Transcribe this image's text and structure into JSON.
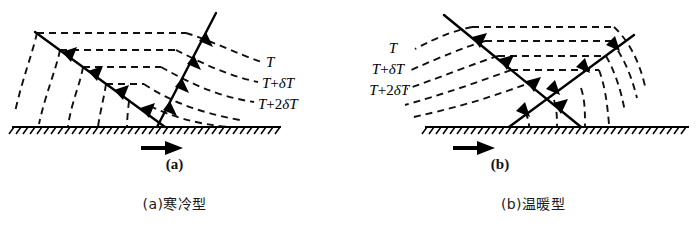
{
  "figure": {
    "title": "",
    "background_color": "#ffffff",
    "line_color": "#000000",
    "width": 697,
    "height": 227
  },
  "panels": [
    {
      "id": "a",
      "sub_label": "(a)",
      "caption": "(a)寒冷型",
      "label_side": "right",
      "isotherms": [
        {
          "main": "T",
          "operator": "",
          "coefficient": "",
          "delta": "",
          "suffix": ""
        },
        {
          "main": "T",
          "operator": "+",
          "coefficient": "",
          "delta": "δ",
          "suffix": "T"
        },
        {
          "main": "T",
          "operator": "+",
          "coefficient": "2",
          "delta": "δ",
          "suffix": "T"
        }
      ],
      "isotherm_labels_plain": [
        "T",
        "T+δT",
        "T+2δT"
      ],
      "flow_arrow": {
        "direction": "right",
        "name": "surface-flow-arrow"
      },
      "ground": {
        "style": "hatched",
        "hatch_direction": "right-leaning"
      }
    },
    {
      "id": "b",
      "sub_label": "(b)",
      "caption": "(b)温暖型",
      "label_side": "left",
      "isotherms": [
        {
          "main": "T",
          "operator": "",
          "coefficient": "",
          "delta": "",
          "suffix": ""
        },
        {
          "main": "T",
          "operator": "+",
          "coefficient": "",
          "delta": "δ",
          "suffix": "T"
        },
        {
          "main": "T",
          "operator": "+",
          "coefficient": "2",
          "delta": "δ",
          "suffix": "T"
        }
      ],
      "isotherm_labels_plain": [
        "T",
        "T+δT",
        "T+2δT"
      ],
      "flow_arrow": {
        "direction": "right",
        "name": "surface-flow-arrow"
      },
      "ground": {
        "style": "hatched",
        "hatch_direction": "right-leaning"
      }
    }
  ]
}
